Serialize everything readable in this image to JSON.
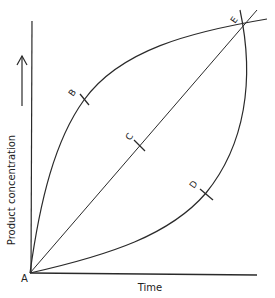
{
  "diagram": {
    "axes": {
      "y_label": "Product concentration",
      "x_label": "Time"
    },
    "points": {
      "A": "A",
      "B": "B",
      "C": "C",
      "D": "D",
      "E": "E"
    },
    "colors": {
      "line": "#2a2a2a",
      "background": "#ffffff"
    },
    "curves": [
      {
        "name": "concave-curve",
        "through": [
          "A",
          "B",
          "E"
        ]
      },
      {
        "name": "straight-line",
        "through": [
          "A",
          "C",
          "E"
        ]
      },
      {
        "name": "convex-curve",
        "through": [
          "A",
          "D",
          "E"
        ]
      }
    ]
  }
}
